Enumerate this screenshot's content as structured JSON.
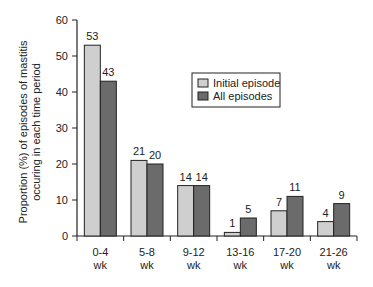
{
  "chart_data": {
    "type": "bar",
    "title": "",
    "xlabel": "",
    "ylabel": "Proportion (%) of episodes of mastitis occuring in each time period",
    "ylabel_lines": [
      "Proportion (%) of episodes of mastitis",
      "occuring in each time period"
    ],
    "ylim": [
      0,
      60
    ],
    "yticks": [
      0,
      10,
      20,
      30,
      40,
      50,
      60
    ],
    "categories": [
      "0-4 wk",
      "5-8 wk",
      "9-12 wk",
      "13-16 wk",
      "17-20 wk",
      "21-26 wk"
    ],
    "category_lines": [
      [
        "0-4",
        "wk"
      ],
      [
        "5-8",
        "wk"
      ],
      [
        "9-12",
        "wk"
      ],
      [
        "13-16",
        "wk"
      ],
      [
        "17-20",
        "wk"
      ],
      [
        "21-26",
        "wk"
      ]
    ],
    "series": [
      {
        "name": "Initial episode",
        "values": [
          53,
          21,
          14,
          1,
          7,
          4
        ],
        "color": "#cfcfcf"
      },
      {
        "name": "All episodes",
        "values": [
          43,
          20,
          14,
          5,
          11,
          9
        ],
        "color": "#6b6b6b"
      }
    ],
    "grid": false,
    "legend_position": "upper right (inside plot)",
    "data_labels": true
  }
}
